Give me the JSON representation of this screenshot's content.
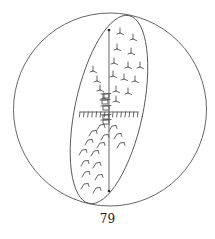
{
  "figure": {
    "caption": "79",
    "stroke_color": "#555555",
    "sphere": {
      "cx": 110,
      "cy": 109.5,
      "r": 96.5
    },
    "great_circle_ellipse": {
      "cx": 109,
      "cy": 109.5,
      "rx": 34,
      "ry": 96,
      "rotate": 12
    },
    "axis_line": {
      "x1": 109,
      "y1": 30,
      "x2": 109,
      "y2": 191
    },
    "axis_endpoints": [
      {
        "x": 109,
        "y": 30
      },
      {
        "x": 109,
        "y": 191
      }
    ],
    "equator_hatched_line": {
      "x1": 80,
      "y1": 112,
      "x2": 138,
      "y2": 112,
      "tick_count": 15,
      "tick_length": 5
    },
    "upper_glyphs": [
      {
        "x": 120,
        "y": 32
      },
      {
        "x": 133,
        "y": 38
      },
      {
        "x": 117,
        "y": 48
      },
      {
        "x": 131,
        "y": 52
      },
      {
        "x": 114,
        "y": 62
      },
      {
        "x": 128,
        "y": 66
      },
      {
        "x": 140,
        "y": 66
      },
      {
        "x": 113,
        "y": 75
      },
      {
        "x": 124,
        "y": 78
      },
      {
        "x": 135,
        "y": 80
      },
      {
        "x": 93,
        "y": 70
      },
      {
        "x": 97,
        "y": 80
      },
      {
        "x": 100,
        "y": 89
      },
      {
        "x": 116,
        "y": 90
      },
      {
        "x": 128,
        "y": 92
      },
      {
        "x": 104,
        "y": 97
      },
      {
        "x": 116,
        "y": 100
      }
    ],
    "lower_glyphs": [
      {
        "x": 100,
        "y": 127
      },
      {
        "x": 112,
        "y": 128
      },
      {
        "x": 92,
        "y": 133
      },
      {
        "x": 104,
        "y": 137
      },
      {
        "x": 117,
        "y": 136
      },
      {
        "x": 88,
        "y": 142
      },
      {
        "x": 100,
        "y": 145
      },
      {
        "x": 120,
        "y": 145
      },
      {
        "x": 82,
        "y": 152
      },
      {
        "x": 94,
        "y": 153
      },
      {
        "x": 84,
        "y": 163
      },
      {
        "x": 96,
        "y": 165
      },
      {
        "x": 85,
        "y": 174
      },
      {
        "x": 98,
        "y": 177
      },
      {
        "x": 84,
        "y": 186
      },
      {
        "x": 96,
        "y": 190
      }
    ],
    "center_stack_glyphs": [
      {
        "x": 106,
        "y": 96
      },
      {
        "x": 105,
        "y": 102
      },
      {
        "x": 106,
        "y": 108
      },
      {
        "x": 106,
        "y": 117
      },
      {
        "x": 106,
        "y": 122
      }
    ]
  }
}
